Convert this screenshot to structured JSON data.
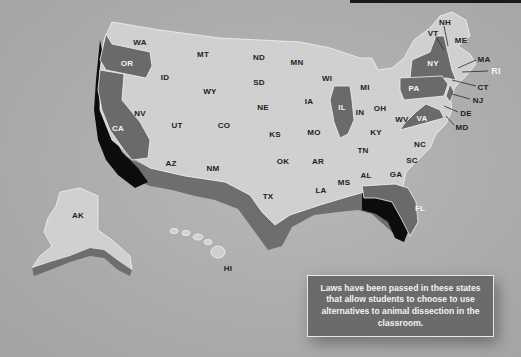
{
  "map": {
    "title": "US states with student choice laws for dissection alternatives",
    "colors": {
      "background": "#adadad",
      "state_default": "#d0d0d0",
      "state_with_law": "#6a6a6a",
      "extrusion_dark": "#0c0c0c",
      "label_dark": "#222222",
      "label_light": "#f4f4f4"
    },
    "states_with_law": [
      "OR",
      "CA",
      "IL",
      "NY",
      "PA",
      "VA",
      "FL",
      "NJ",
      "RI"
    ],
    "labels": [
      {
        "id": "WA",
        "x": 140,
        "y": 42
      },
      {
        "id": "OR",
        "x": 127,
        "y": 63,
        "law": true
      },
      {
        "id": "CA",
        "x": 118,
        "y": 128,
        "law": true
      },
      {
        "id": "NV",
        "x": 140,
        "y": 113
      },
      {
        "id": "ID",
        "x": 165,
        "y": 77
      },
      {
        "id": "MT",
        "x": 203,
        "y": 54
      },
      {
        "id": "WY",
        "x": 210,
        "y": 91
      },
      {
        "id": "UT",
        "x": 177,
        "y": 125
      },
      {
        "id": "AZ",
        "x": 171,
        "y": 163
      },
      {
        "id": "CO",
        "x": 224,
        "y": 125
      },
      {
        "id": "NM",
        "x": 213,
        "y": 168
      },
      {
        "id": "ND",
        "x": 259,
        "y": 57
      },
      {
        "id": "SD",
        "x": 259,
        "y": 82
      },
      {
        "id": "NE",
        "x": 263,
        "y": 107
      },
      {
        "id": "KS",
        "x": 275,
        "y": 134
      },
      {
        "id": "OK",
        "x": 283,
        "y": 161
      },
      {
        "id": "TX",
        "x": 268,
        "y": 196
      },
      {
        "id": "MN",
        "x": 297,
        "y": 62
      },
      {
        "id": "IA",
        "x": 309,
        "y": 101
      },
      {
        "id": "MO",
        "x": 314,
        "y": 132
      },
      {
        "id": "AR",
        "x": 318,
        "y": 161
      },
      {
        "id": "LA",
        "x": 321,
        "y": 190
      },
      {
        "id": "WI",
        "x": 327,
        "y": 78
      },
      {
        "id": "IL",
        "x": 342,
        "y": 107,
        "law": true
      },
      {
        "id": "MS",
        "x": 344,
        "y": 182
      },
      {
        "id": "MI",
        "x": 365,
        "y": 87
      },
      {
        "id": "IN",
        "x": 360,
        "y": 112
      },
      {
        "id": "OH",
        "x": 380,
        "y": 108
      },
      {
        "id": "KY",
        "x": 376,
        "y": 132
      },
      {
        "id": "TN",
        "x": 363,
        "y": 150
      },
      {
        "id": "AL",
        "x": 366,
        "y": 175
      },
      {
        "id": "GA",
        "x": 396,
        "y": 174
      },
      {
        "id": "FL",
        "x": 420,
        "y": 208,
        "law": true
      },
      {
        "id": "SC",
        "x": 412,
        "y": 160
      },
      {
        "id": "NC",
        "x": 420,
        "y": 144
      },
      {
        "id": "WV",
        "x": 402,
        "y": 119
      },
      {
        "id": "VA",
        "x": 422,
        "y": 118,
        "law": true
      },
      {
        "id": "PA",
        "x": 414,
        "y": 88,
        "law": true
      },
      {
        "id": "NY",
        "x": 433,
        "y": 63,
        "law": true
      },
      {
        "id": "VT",
        "x": 433,
        "y": 33
      },
      {
        "id": "NH",
        "x": 445,
        "y": 22
      },
      {
        "id": "ME",
        "x": 461,
        "y": 40
      },
      {
        "id": "MA",
        "x": 484,
        "y": 59
      },
      {
        "id": "RI",
        "x": 496,
        "y": 71,
        "callout_white": true
      },
      {
        "id": "CT",
        "x": 483,
        "y": 87
      },
      {
        "id": "NJ",
        "x": 478,
        "y": 100
      },
      {
        "id": "DE",
        "x": 466,
        "y": 113
      },
      {
        "id": "MD",
        "x": 462,
        "y": 127
      },
      {
        "id": "AK",
        "x": 78,
        "y": 215
      },
      {
        "id": "HI",
        "x": 228,
        "y": 268
      }
    ]
  },
  "info_box": {
    "text": "Laws have been passed in these states that allow students to choose to use alternatives to animal dissection in the classroom."
  }
}
